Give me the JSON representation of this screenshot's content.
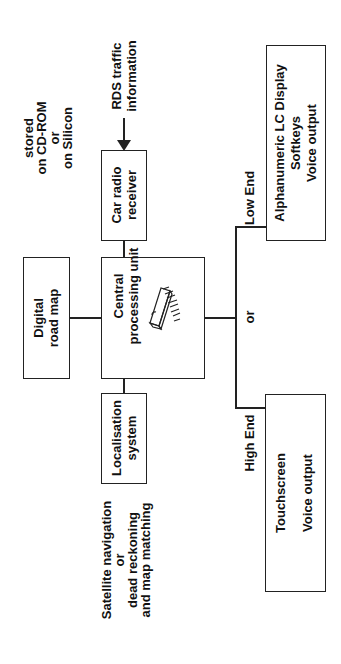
{
  "diagram": {
    "orientation": "rotated -90deg",
    "nodes": {
      "cpu": {
        "label_line1": "Central",
        "label_line2": "processing unit",
        "icon": "chip-icon"
      },
      "road_map": {
        "label_line1": "Digital",
        "label_line2": "road map"
      },
      "radio": {
        "label_line1": "Car radio",
        "label_line2": "receiver"
      },
      "localisation": {
        "label_line1": "Localisation",
        "label_line2": "system"
      },
      "low_end_display": {
        "line1": "Alphanumeric LC Display",
        "line2": "Softkeys",
        "line3": "Voice output"
      },
      "high_end_display": {
        "line1": "Touchscreen",
        "line2": "Voice output"
      }
    },
    "annotations": {
      "storage": {
        "line1": "stored",
        "line2": "on CD-ROM",
        "line3": "or",
        "line4": "on Silicon"
      },
      "rds": {
        "line1": "RDS traffic",
        "line2": "information"
      },
      "positioning": {
        "line1": "Satellite navigation",
        "line2": "or",
        "line3": "dead reckoning",
        "line4": "and map matching"
      },
      "low_end": "Low End",
      "high_end": "High End",
      "or_branch": "or"
    }
  }
}
